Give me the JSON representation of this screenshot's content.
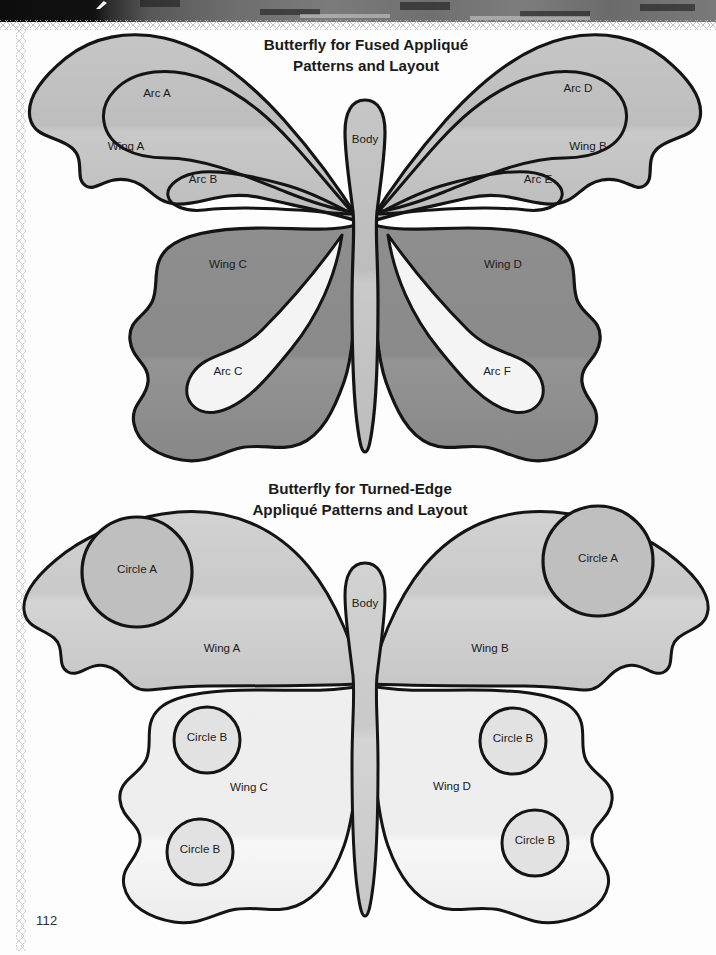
{
  "page": {
    "number": "112",
    "background_color": "#fdfdfd",
    "ink_color": "#141414"
  },
  "scan_artifacts": {
    "top_band_label": "scanned-page-edge",
    "left_edge_label": "zigzag-page-edge"
  },
  "figures": [
    {
      "id": "fused-applique-butterfly",
      "title_line1": "Butterfly for Fused Appliqué",
      "title_line2": "Patterns and Layout",
      "colors": {
        "upper_wing": "#bdbdbd",
        "lower_wing": "#8a8a8a",
        "arc_light": "#f4f4f4",
        "arc_mid": "#b5b5b5",
        "body": "#bdbdbd"
      },
      "labels": [
        {
          "name": "body",
          "text": "Body",
          "x": 365,
          "y": 143
        },
        {
          "name": "wing-a",
          "text": "Wing A",
          "x": 126,
          "y": 150
        },
        {
          "name": "wing-b",
          "text": "Wing B",
          "x": 588,
          "y": 150
        },
        {
          "name": "arc-a",
          "text": "Arc A",
          "x": 157,
          "y": 97
        },
        {
          "name": "arc-d",
          "text": "Arc D",
          "x": 578,
          "y": 92
        },
        {
          "name": "arc-b",
          "text": "Arc B",
          "x": 203,
          "y": 183
        },
        {
          "name": "arc-e",
          "text": "Arc E",
          "x": 538,
          "y": 183
        },
        {
          "name": "wing-c",
          "text": "Wing C",
          "x": 228,
          "y": 268
        },
        {
          "name": "wing-d",
          "text": "Wing D",
          "x": 503,
          "y": 268
        },
        {
          "name": "arc-c",
          "text": "Arc C",
          "x": 228,
          "y": 375
        },
        {
          "name": "arc-f",
          "text": "Arc F",
          "x": 497,
          "y": 375
        }
      ]
    },
    {
      "id": "turned-edge-applique-butterfly",
      "title_line1": "Butterfly for Turned-Edge",
      "title_line2": "Appliqué Patterns and Layout",
      "colors": {
        "upper_wing": "#cbcbcb",
        "lower_wing": "#f0f0f0",
        "circle_a": "#bfbfbf",
        "circle_b": "#e2e2e2",
        "body": "#c4c4c4"
      },
      "labels": [
        {
          "name": "body",
          "text": "Body",
          "x": 365,
          "y": 607
        },
        {
          "name": "wing-a",
          "text": "Wing A",
          "x": 222,
          "y": 652
        },
        {
          "name": "wing-b",
          "text": "Wing B",
          "x": 490,
          "y": 652
        },
        {
          "name": "circle-a-left",
          "text": "Circle A",
          "x": 137,
          "y": 573
        },
        {
          "name": "circle-a-right",
          "text": "Circle A",
          "x": 598,
          "y": 562
        },
        {
          "name": "wing-c",
          "text": "Wing C",
          "x": 249,
          "y": 791
        },
        {
          "name": "wing-d",
          "text": "Wing D",
          "x": 452,
          "y": 790
        },
        {
          "name": "circle-b-upper-left",
          "text": "Circle B",
          "x": 207,
          "y": 741
        },
        {
          "name": "circle-b-lower-left",
          "text": "Circle B",
          "x": 200,
          "y": 853
        },
        {
          "name": "circle-b-upper-right",
          "text": "Circle B",
          "x": 513,
          "y": 742
        },
        {
          "name": "circle-b-lower-right",
          "text": "Circle B",
          "x": 535,
          "y": 844
        }
      ]
    }
  ]
}
